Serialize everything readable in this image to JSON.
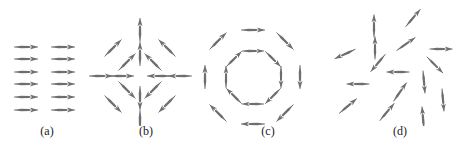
{
  "figure": {
    "width": 467,
    "height": 154,
    "background_color": "#ffffff",
    "arrow_color": "#6e6e70",
    "label_color": "#1a1a1a",
    "panel_count": 4
  },
  "panels": [
    {
      "id": "panel-a",
      "label": "(a)",
      "label_x": 47,
      "label_y": 131,
      "pattern": "uniform-ferromagnetic",
      "origin_x": 0,
      "origin_y": 0,
      "arrows": [
        {
          "x": 26,
          "y": 47,
          "angle": 0,
          "len": 24
        },
        {
          "x": 63,
          "y": 47,
          "angle": 0,
          "len": 24
        },
        {
          "x": 26,
          "y": 59,
          "angle": 0,
          "len": 24
        },
        {
          "x": 63,
          "y": 59,
          "angle": 0,
          "len": 24
        },
        {
          "x": 26,
          "y": 72,
          "angle": 0,
          "len": 24
        },
        {
          "x": 63,
          "y": 72,
          "angle": 0,
          "len": 24
        },
        {
          "x": 26,
          "y": 84,
          "angle": 0,
          "len": 24
        },
        {
          "x": 63,
          "y": 84,
          "angle": 0,
          "len": 24
        },
        {
          "x": 26,
          "y": 97,
          "angle": 0,
          "len": 24
        },
        {
          "x": 63,
          "y": 97,
          "angle": 0,
          "len": 24
        },
        {
          "x": 26,
          "y": 110,
          "angle": 0,
          "len": 24
        },
        {
          "x": 63,
          "y": 110,
          "angle": 0,
          "len": 24
        }
      ]
    },
    {
      "id": "panel-b",
      "label": "(b)",
      "label_x": 146,
      "label_y": 131,
      "pattern": "radial-convergent-hedgehog",
      "origin_x": 0,
      "origin_y": 0,
      "arrows": [
        {
          "x": 140,
          "y": 30,
          "angle": 90,
          "len": 24
        },
        {
          "x": 140,
          "y": 54,
          "angle": 90,
          "len": 24
        },
        {
          "x": 140,
          "y": 98,
          "angle": 270,
          "len": 24
        },
        {
          "x": 140,
          "y": 122,
          "angle": 270,
          "len": 24
        },
        {
          "x": 101,
          "y": 76,
          "angle": 0,
          "len": 24
        },
        {
          "x": 122,
          "y": 76,
          "angle": 0,
          "len": 24
        },
        {
          "x": 159,
          "y": 76,
          "angle": 180,
          "len": 24
        },
        {
          "x": 180,
          "y": 76,
          "angle": 180,
          "len": 24
        },
        {
          "x": 113,
          "y": 48,
          "angle": 45,
          "len": 24
        },
        {
          "x": 127,
          "y": 62,
          "angle": 45,
          "len": 24
        },
        {
          "x": 167,
          "y": 48,
          "angle": 135,
          "len": 24
        },
        {
          "x": 153,
          "y": 62,
          "angle": 135,
          "len": 24
        },
        {
          "x": 113,
          "y": 104,
          "angle": 315,
          "len": 24
        },
        {
          "x": 127,
          "y": 90,
          "angle": 315,
          "len": 24
        },
        {
          "x": 167,
          "y": 104,
          "angle": 225,
          "len": 24
        },
        {
          "x": 153,
          "y": 90,
          "angle": 225,
          "len": 24
        }
      ]
    },
    {
      "id": "panel-c",
      "label": "(c)",
      "label_x": 268,
      "label_y": 131,
      "pattern": "vortex-curling-clockwise",
      "origin_x": 0,
      "origin_y": 0,
      "arrows": [
        {
          "x": 253,
          "y": 51,
          "angle": 0,
          "len": 22
        },
        {
          "x": 273,
          "y": 59,
          "angle": 315,
          "len": 22
        },
        {
          "x": 281,
          "y": 77,
          "angle": 270,
          "len": 22
        },
        {
          "x": 273,
          "y": 96,
          "angle": 225,
          "len": 22
        },
        {
          "x": 253,
          "y": 104,
          "angle": 180,
          "len": 22
        },
        {
          "x": 234,
          "y": 96,
          "angle": 135,
          "len": 22
        },
        {
          "x": 226,
          "y": 77,
          "angle": 90,
          "len": 22
        },
        {
          "x": 234,
          "y": 59,
          "angle": 45,
          "len": 22
        },
        {
          "x": 253,
          "y": 30,
          "angle": 0,
          "len": 24
        },
        {
          "x": 285,
          "y": 41,
          "angle": 315,
          "len": 24
        },
        {
          "x": 300,
          "y": 77,
          "angle": 270,
          "len": 24
        },
        {
          "x": 285,
          "y": 113,
          "angle": 225,
          "len": 24
        },
        {
          "x": 253,
          "y": 124,
          "angle": 180,
          "len": 24
        },
        {
          "x": 218,
          "y": 113,
          "angle": 135,
          "len": 24
        },
        {
          "x": 205,
          "y": 77,
          "angle": 90,
          "len": 24
        },
        {
          "x": 218,
          "y": 41,
          "angle": 45,
          "len": 24
        }
      ]
    },
    {
      "id": "panel-d",
      "label": "(d)",
      "label_x": 400,
      "label_y": 131,
      "pattern": "random-disordered-paramagnetic",
      "origin_x": 0,
      "origin_y": 0,
      "arrows": [
        {
          "x": 374,
          "y": 26,
          "angle": 90,
          "len": 23
        },
        {
          "x": 413,
          "y": 18,
          "angle": 50,
          "len": 23
        },
        {
          "x": 375,
          "y": 48,
          "angle": 90,
          "len": 23
        },
        {
          "x": 406,
          "y": 44,
          "angle": 35,
          "len": 23
        },
        {
          "x": 345,
          "y": 54,
          "angle": 205,
          "len": 23
        },
        {
          "x": 378,
          "y": 63,
          "angle": 230,
          "len": 23
        },
        {
          "x": 441,
          "y": 49,
          "angle": 0,
          "len": 23
        },
        {
          "x": 435,
          "y": 65,
          "angle": 315,
          "len": 23
        },
        {
          "x": 398,
          "y": 72,
          "angle": 180,
          "len": 23
        },
        {
          "x": 424,
          "y": 82,
          "angle": 275,
          "len": 23
        },
        {
          "x": 358,
          "y": 84,
          "angle": 180,
          "len": 23
        },
        {
          "x": 400,
          "y": 92,
          "angle": 55,
          "len": 23
        },
        {
          "x": 443,
          "y": 100,
          "angle": 275,
          "len": 23
        },
        {
          "x": 387,
          "y": 112,
          "angle": 50,
          "len": 23
        },
        {
          "x": 423,
          "y": 118,
          "angle": 95,
          "len": 23
        },
        {
          "x": 348,
          "y": 106,
          "angle": 40,
          "len": 23
        }
      ]
    }
  ]
}
